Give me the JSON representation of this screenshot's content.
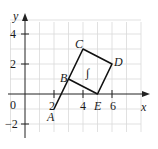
{
  "diagram": {
    "axes": {
      "x_label": "x",
      "y_label": "y",
      "origin_label": "0",
      "x_ticks": [
        {
          "value": 2,
          "label": "2"
        },
        {
          "value": 4,
          "label": "4"
        },
        {
          "value": 6,
          "label": "6"
        }
      ],
      "y_ticks": [
        {
          "value": 4,
          "label": "4"
        },
        {
          "value": 2,
          "label": "2"
        },
        {
          "value": -2,
          "label": "−2"
        }
      ]
    },
    "points": {
      "A": {
        "label": "A",
        "x": 2,
        "y": -1
      },
      "B": {
        "label": "B",
        "x": 3,
        "y": 1
      },
      "C": {
        "label": "C",
        "x": 4,
        "y": 3
      },
      "D": {
        "label": "D",
        "x": 6,
        "y": 2
      },
      "E": {
        "label": "E",
        "x": 5,
        "y": 0
      }
    },
    "region_label": "∫",
    "segments": [
      "A-B",
      "B-C",
      "C-D",
      "D-E",
      "E-B"
    ],
    "colors": {
      "grid": "#d6d6d6",
      "axis": "#222222",
      "shape": "#111111"
    }
  }
}
